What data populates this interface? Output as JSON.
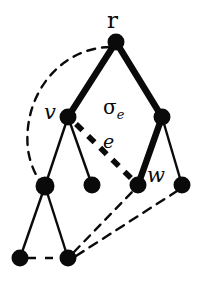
{
  "figure": {
    "type": "graph-diagram",
    "background_color": "#ffffff",
    "ink_color": "#0a0a0a",
    "width": 205,
    "height": 288
  },
  "labels": {
    "root": "r",
    "v": "v",
    "w": "w",
    "edge": "e",
    "sigma": "σ",
    "sigma_subscript": "e"
  },
  "nodes": [
    {
      "id": "r",
      "label": "r",
      "cx": 116,
      "cy": 42,
      "r": 8
    },
    {
      "id": "v",
      "label": "v",
      "cx": 68,
      "cy": 117,
      "r": 8
    },
    {
      "id": "x",
      "label": "",
      "cx": 162,
      "cy": 117,
      "r": 8
    },
    {
      "id": "a",
      "label": "",
      "cx": 45,
      "cy": 186,
      "r": 9
    },
    {
      "id": "b",
      "label": "",
      "cx": 92,
      "cy": 185,
      "r": 8
    },
    {
      "id": "w",
      "label": "w",
      "cx": 138,
      "cy": 185,
      "r": 8
    },
    {
      "id": "d",
      "label": "",
      "cx": 182,
      "cy": 185,
      "r": 8
    },
    {
      "id": "p",
      "label": "",
      "cx": 20,
      "cy": 258,
      "r": 8
    },
    {
      "id": "q",
      "label": "",
      "cx": 68,
      "cy": 258,
      "r": 8
    }
  ],
  "edges_bold": [
    {
      "from": "r",
      "to": "v",
      "width": 6
    },
    {
      "from": "r",
      "to": "x",
      "width": 6
    },
    {
      "from": "x",
      "to": "w",
      "width": 6
    }
  ],
  "edges_thin": [
    {
      "from": "v",
      "to": "a",
      "width": 2
    },
    {
      "from": "v",
      "to": "b",
      "width": 2
    },
    {
      "from": "x",
      "to": "d",
      "width": 2
    },
    {
      "from": "a",
      "to": "p",
      "width": 2
    },
    {
      "from": "a",
      "to": "q",
      "width": 2
    }
  ],
  "edges_dashed": [
    {
      "id": "e-edge",
      "from": "v",
      "to": "w",
      "width": 5,
      "dash": "9 7",
      "style": "bold-dashed"
    },
    {
      "id": "back-arc-r-a",
      "from": "r",
      "to": "a",
      "width": 2,
      "dash": "7 6",
      "style": "curved"
    },
    {
      "id": "back-q-w",
      "from": "q",
      "to": "w",
      "width": 2,
      "dash": "7 6",
      "style": "straight"
    },
    {
      "id": "back-q-d",
      "from": "q",
      "to": "d",
      "width": 2,
      "dash": "7 6",
      "style": "straight"
    },
    {
      "id": "bottom-p-q",
      "from": "p",
      "to": "q",
      "width": 2,
      "dash": "7 6",
      "style": "straight"
    }
  ],
  "label_positions": {
    "r": {
      "x": 107,
      "y": 9
    },
    "v": {
      "x": 44,
      "y": 101
    },
    "w": {
      "x": 147,
      "y": 165
    },
    "e": {
      "x": 102,
      "y": 132
    },
    "sigma": {
      "x": 103,
      "y": 97
    }
  }
}
